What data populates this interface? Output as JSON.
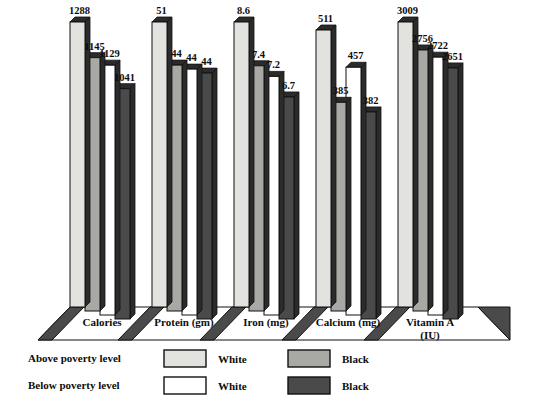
{
  "chart_data": {
    "type": "bar",
    "title": "",
    "subtitle": "",
    "xlabel": "",
    "ylabel": "",
    "grid": false,
    "legend_position": "bottom-left",
    "categories": [
      "Calories",
      "Protein (gm)",
      "Iron (mg)",
      "Calcium (mg)",
      "Vitamin A\n(IU)"
    ],
    "category_lines": [
      [
        "Calories"
      ],
      [
        "Protein (gm)"
      ],
      [
        "Iron (mg)"
      ],
      [
        "Calcium (mg)"
      ],
      [
        "Vitamin A",
        "(IU)"
      ]
    ],
    "series": [
      {
        "name": "Above poverty level - White",
        "group": "Above poverty level",
        "race": "White",
        "color": "#e2e2de",
        "values": [
          1288,
          51,
          8.6,
          511,
          3009
        ],
        "labels": [
          "1288",
          "51",
          "8.6",
          "511",
          "3009"
        ]
      },
      {
        "name": "Above poverty level - Black",
        "group": "Above poverty level",
        "race": "Black",
        "color": "#a8a8a4",
        "values": [
          1145,
          44,
          7.4,
          385,
          2756
        ],
        "labels": [
          "1145",
          "44",
          "7.4",
          "385",
          "2756"
        ]
      },
      {
        "name": "Below poverty level - White",
        "group": "Below poverty level",
        "race": "White",
        "color": "#ffffff",
        "values": [
          1129,
          44,
          7.2,
          457,
          2722
        ],
        "labels": [
          "1129",
          "44",
          "7.2",
          "457",
          "2722"
        ]
      },
      {
        "name": "Below poverty level - Black",
        "group": "Below poverty level",
        "race": "Black",
        "color": "#4a4a4a",
        "values": [
          1041,
          44,
          6.7,
          382,
          2651
        ],
        "labels": [
          "1041",
          "44",
          "6.7",
          "382",
          "2651"
        ]
      }
    ]
  },
  "legend": {
    "rows": [
      {
        "label": "Above poverty level",
        "swatch_white": "#e2e2de",
        "swatch_black": "#a8a8a4"
      },
      {
        "label": "Below poverty level",
        "swatch_white": "#ffffff",
        "swatch_black": "#4a4a4a"
      }
    ],
    "race_white_label": "White",
    "race_black_label": "Black"
  },
  "colors": {
    "above_white": "#e2e2de",
    "above_black": "#a8a8a4",
    "below_white": "#ffffff",
    "below_black": "#4a4a4a",
    "floor_shadow": "#4a4a4a",
    "outline": "#111111",
    "background": "#ffffff"
  },
  "caption": {
    "text": ""
  }
}
